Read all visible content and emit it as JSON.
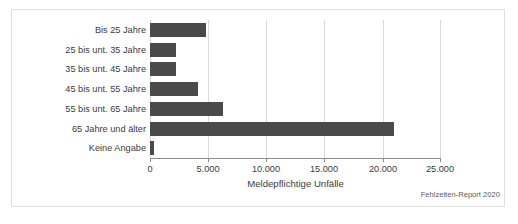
{
  "chart_data": {
    "type": "bar",
    "orientation": "horizontal",
    "title": "",
    "xlabel": "Meldepflichtige Unfälle",
    "ylabel": "",
    "xlim": [
      0,
      25000
    ],
    "grid": true,
    "legend": false,
    "bar_color": "#4a4a4a",
    "categories": [
      "Bis 25 Jahre",
      "25 bis unt. 35 Jahre",
      "35 bis unt. 45 Jahre",
      "45 bis unt. 55 Jahre",
      "55 bis unt. 65 Jahre",
      "65 Jahre und älter",
      "Keine Angabe"
    ],
    "values": [
      4830,
      2250,
      2270,
      4150,
      6250,
      21000,
      350
    ],
    "xticks": [
      0,
      5000,
      10000,
      15000,
      20000,
      25000
    ],
    "xticklabels": [
      "0",
      "5.000",
      "10.000",
      "15.000",
      "20.000",
      "25.000"
    ],
    "source_note": "Fehlzeiten-Report 2020"
  }
}
